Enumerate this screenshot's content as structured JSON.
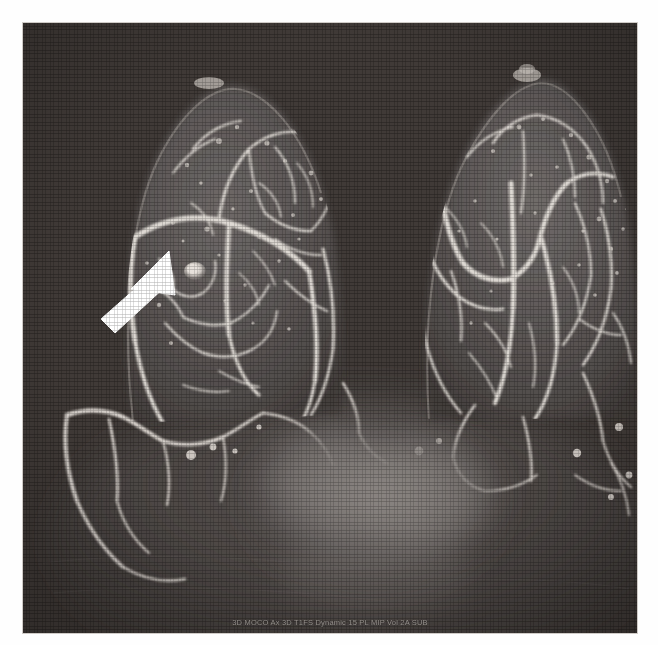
{
  "image": {
    "modality_caption": "3D MOCO Ax 3D T1FS Dynamic 15 PL MIP  Vol 2A SUB",
    "view_description": "Bilateral breast MR maximum-intensity-projection (MIP), subtracted contrast-enhanced",
    "background_color": "#3a3431",
    "tissue_color": "#565251",
    "vessel_color": "#ded9d3",
    "marker_color": "#ffffff",
    "frame": {
      "x": 23,
      "y": 23,
      "width": 614,
      "height": 610
    }
  },
  "annotations": {
    "arrow": {
      "label": "lesion-pointer-arrow",
      "color": "#ffffff",
      "tail_x": 100,
      "tail_y": 312,
      "tip_x": 166,
      "tip_y": 254
    },
    "lesion": {
      "label": "enhancing-mass",
      "center_x": 172,
      "center_y": 248,
      "radius": 9,
      "brightness": "#ded8d2"
    }
  },
  "structures": [
    {
      "name": "left-breast",
      "side": "left",
      "apex_x": 182,
      "apex_y": 60
    },
    {
      "name": "right-breast",
      "side": "right",
      "apex_x": 500,
      "apex_y": 52
    },
    {
      "name": "left-nipple",
      "cx": 182,
      "cy": 62
    },
    {
      "name": "right-nipple",
      "cx": 500,
      "cy": 54
    },
    {
      "name": "mediastinum-heart-blush",
      "cx": 355,
      "cy": 480
    }
  ]
}
